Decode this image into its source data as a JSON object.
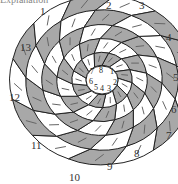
{
  "caption_fragment": "Explanation",
  "outer_labels": [
    "1",
    "2",
    "3",
    "4",
    "5",
    "6",
    "7",
    "8",
    "9",
    "10",
    "11",
    "12",
    "13"
  ],
  "inner_labels": [
    "7",
    "8",
    "1",
    "6",
    "2",
    "5",
    "4",
    "3"
  ],
  "colors": {
    "shaded": "#a8a8a8",
    "light": "#ffffff",
    "stroke": "#222222",
    "arrow": "#666666"
  },
  "spiral_count": 13,
  "ring_count": 5
}
